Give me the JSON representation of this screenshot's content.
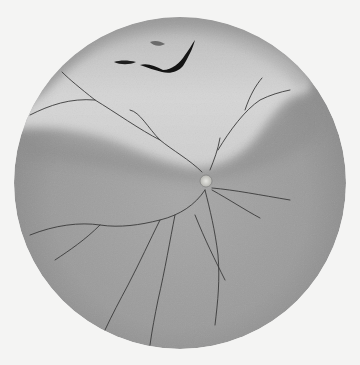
{
  "image": {
    "subject": "fundus illustration",
    "features": [
      "optic disc",
      "retinal vessels",
      "retinal tear",
      "elevated detached retina"
    ],
    "colors": {
      "background": "#f4f4f3",
      "fundus_dark": "#8f8f8f",
      "fundus_mid": "#a3a3a3",
      "detached_light": "#d2d2d2",
      "vessel": "#3a3a3a",
      "tear": "#141414",
      "disc": "#d8d8d4"
    }
  }
}
